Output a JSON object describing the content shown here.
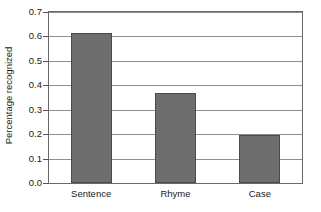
{
  "chart_data": {
    "type": "bar",
    "title": "",
    "subtitle": "",
    "xlabel": "",
    "ylabel": "Percentage recognized",
    "categories": [
      "Sentence",
      "Rhyme",
      "Case"
    ],
    "values": [
      0.615,
      0.37,
      0.195
    ],
    "series": [
      {
        "name": "Percentage recognized",
        "values": [
          0.615,
          0.37,
          0.195
        ]
      }
    ],
    "ylim": [
      0.0,
      0.7
    ],
    "xlim": [
      0,
      3
    ],
    "yticks": [
      "0.0",
      "0.1",
      "0.2",
      "0.3",
      "0.4",
      "0.5",
      "0.6",
      "0.7"
    ],
    "ytick_values": [
      0.0,
      0.1,
      0.2,
      0.3,
      0.4,
      0.5,
      0.6,
      0.7
    ],
    "grid": "horizontal",
    "legend": "none",
    "colors": {
      "bar_fill": "#6e6e6e",
      "bar_edge": "#4a4a4a",
      "gridline": "#8f8f8f",
      "frame": "#6a6a6a",
      "background": "#ffffff",
      "text": "#1a1a1a"
    }
  }
}
